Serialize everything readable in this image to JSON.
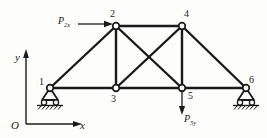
{
  "figure": {
    "type": "truss-free-body-diagram",
    "stroke_color": "#1a1a1a",
    "node_fill": "#ffffff",
    "background": "#fdfdfc"
  },
  "axes": {
    "origin_label": "O",
    "y_label": "y",
    "x_label": "x"
  },
  "nodes": [
    {
      "id": "1",
      "label": "1",
      "x": 50,
      "y": 88,
      "label_x": 39,
      "label_y": 79,
      "support": "roller"
    },
    {
      "id": "2",
      "label": "2",
      "x": 116,
      "y": 26,
      "label_x": 110,
      "label_y": 11,
      "support": "none"
    },
    {
      "id": "3",
      "label": "3",
      "x": 116,
      "y": 88,
      "label_x": 111,
      "label_y": 95,
      "support": "none"
    },
    {
      "id": "4",
      "label": "4",
      "x": 182,
      "y": 26,
      "label_x": 184,
      "label_y": 11,
      "support": "none"
    },
    {
      "id": "5",
      "label": "5",
      "x": 182,
      "y": 88,
      "label_x": 188,
      "label_y": 93,
      "support": "none"
    },
    {
      "id": "6",
      "label": "6",
      "x": 246,
      "y": 88,
      "label_x": 249,
      "label_y": 77,
      "support": "roller"
    }
  ],
  "members": [
    {
      "from": "1",
      "to": "2"
    },
    {
      "from": "2",
      "to": "4"
    },
    {
      "from": "4",
      "to": "6"
    },
    {
      "from": "1",
      "to": "3"
    },
    {
      "from": "3",
      "to": "5"
    },
    {
      "from": "5",
      "to": "6"
    },
    {
      "from": "2",
      "to": "3"
    },
    {
      "from": "4",
      "to": "5"
    },
    {
      "from": "2",
      "to": "5"
    },
    {
      "from": "3",
      "to": "4"
    }
  ],
  "forces": [
    {
      "name": "P2x",
      "label_main": "P",
      "label_sub": "2x",
      "direction": "right",
      "applied_at_node": "2",
      "label_x": 58,
      "label_y": 18,
      "arrow_from_x": 78,
      "arrow_from_y": 24,
      "arrow_to_x": 112,
      "arrow_to_y": 24
    },
    {
      "name": "P5y",
      "label_main": "P",
      "label_sub": "5y",
      "direction": "down",
      "applied_at_node": "5",
      "label_x": 183,
      "label_y": 116,
      "arrow_from_x": 182,
      "arrow_from_y": 90,
      "arrow_to_x": 182,
      "arrow_to_y": 114
    }
  ]
}
